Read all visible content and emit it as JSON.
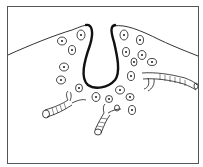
{
  "diagram": {
    "type": "histology-illustration",
    "colors": {
      "background": "#ffffff",
      "line": "#1a1a1a",
      "frame": "#555555"
    },
    "components": [
      {
        "id": "surface",
        "label": ""
      },
      {
        "id": "invagination",
        "label": ""
      },
      {
        "id": "cells",
        "count": 20,
        "label": ""
      },
      {
        "id": "vessels",
        "count": 3,
        "label": ""
      }
    ]
  }
}
